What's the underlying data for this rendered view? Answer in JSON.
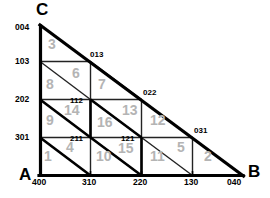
{
  "diagram": {
    "colors": {
      "outline": "#000000",
      "grid": "#222222",
      "region_label": "#b4b4b4",
      "background": "#ffffff"
    },
    "vertices": [
      {
        "name": "vertex-c",
        "label": "C",
        "x": 38,
        "y": 2
      },
      {
        "name": "vertex-a",
        "label": "A",
        "x": 20,
        "y": 174
      },
      {
        "name": "vertex-b",
        "label": "B",
        "x": 247,
        "y": 170
      }
    ],
    "left_axis_labels": [
      {
        "label": "004",
        "x": 16,
        "y": 25
      },
      {
        "label": "103",
        "x": 16,
        "y": 57
      },
      {
        "label": "202",
        "x": 16,
        "y": 95
      },
      {
        "label": "301",
        "x": 16,
        "y": 133
      }
    ],
    "bottom_axis_labels": [
      {
        "label": "400",
        "x": 31,
        "y": 180
      },
      {
        "label": "310",
        "x": 82,
        "y": 180
      },
      {
        "label": "220",
        "x": 133,
        "y": 180
      },
      {
        "label": "130",
        "x": 184,
        "y": 180
      },
      {
        "label": "040",
        "x": 228,
        "y": 180
      }
    ],
    "hypotenuse_labels": [
      {
        "label": "013",
        "x": 89,
        "y": 52
      },
      {
        "label": "022",
        "x": 141,
        "y": 90
      },
      {
        "label": "031",
        "x": 192,
        "y": 128
      }
    ],
    "interior_labels": [
      {
        "label": "112",
        "x": 72,
        "y": 98
      },
      {
        "label": "211",
        "x": 72,
        "y": 136
      },
      {
        "label": "121",
        "x": 123,
        "y": 136
      }
    ],
    "regions": [
      {
        "label": "1",
        "x": 44,
        "y": 151
      },
      {
        "label": "2",
        "x": 205,
        "y": 151
      },
      {
        "label": "3",
        "x": 47,
        "y": 38
      },
      {
        "label": "4",
        "x": 67,
        "y": 140
      },
      {
        "label": "5",
        "x": 178,
        "y": 140
      },
      {
        "label": "6",
        "x": 73,
        "y": 67
      },
      {
        "label": "7",
        "x": 97,
        "y": 78
      },
      {
        "label": "8",
        "x": 46,
        "y": 78
      },
      {
        "label": "9",
        "x": 46,
        "y": 114
      },
      {
        "label": "10",
        "x": 98,
        "y": 151
      },
      {
        "label": "11",
        "x": 152,
        "y": 151
      },
      {
        "label": "12",
        "x": 152,
        "y": 114
      },
      {
        "label": "13",
        "x": 124,
        "y": 104
      },
      {
        "label": "14",
        "x": 66,
        "y": 104
      },
      {
        "label": "15",
        "x": 120,
        "y": 140
      },
      {
        "label": "16",
        "x": 99,
        "y": 116
      }
    ]
  }
}
